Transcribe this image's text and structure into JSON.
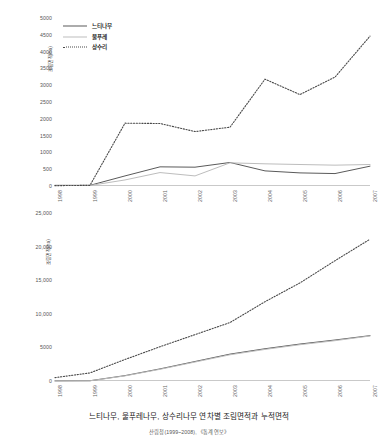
{
  "caption": {
    "title": "느티나무, 물푸레나무, 상수리나무 연차별 조림면적과 누적면적",
    "source": "산림청(1999~2008), 《통계연보》"
  },
  "legend": {
    "position": "top-left",
    "items": [
      {
        "label": "느티나무",
        "style": "solid-dark",
        "color": "#5a5a5a"
      },
      {
        "label": "물푸레",
        "style": "solid-light",
        "color": "#bdbdbd"
      },
      {
        "label": "상수리",
        "style": "dotted",
        "color": "#4a4a4a"
      }
    ]
  },
  "chart_data": [
    {
      "type": "line",
      "title": "",
      "xlabel": "",
      "ylabel": "조림면적(ha)",
      "grid": false,
      "legend_position": "top-left",
      "x": [
        "1998",
        "1999",
        "2000",
        "2001",
        "2002",
        "2003",
        "2004",
        "2005",
        "2006",
        "2007"
      ],
      "xlim": [
        0,
        9
      ],
      "ylim": [
        0,
        5000
      ],
      "yticks": [
        0,
        500,
        1000,
        1500,
        2000,
        2500,
        3000,
        3500,
        4000,
        4500,
        5000
      ],
      "ytick_labels": [
        "0",
        "500",
        "1000",
        "1500",
        "2000",
        "2500",
        "3000",
        "3500",
        "4000",
        "4500",
        "5000"
      ],
      "series": [
        {
          "name": "느티나무",
          "style": "solid-dark",
          "color": "#5a5a5a",
          "values": [
            20,
            20,
            300,
            570,
            560,
            700,
            450,
            390,
            370,
            590
          ]
        },
        {
          "name": "물푸레",
          "style": "solid-light",
          "color": "#bdbdbd",
          "values": [
            15,
            15,
            180,
            400,
            300,
            690,
            660,
            640,
            620,
            640
          ]
        },
        {
          "name": "상수리",
          "style": "dotted",
          "color": "#4a4a4a",
          "values": [
            10,
            20,
            1870,
            1860,
            1620,
            1750,
            3180,
            2720,
            3240,
            4460
          ]
        }
      ]
    },
    {
      "type": "line",
      "title": "",
      "xlabel": "",
      "ylabel": "조림면적(ha)",
      "grid": false,
      "legend_position": "none",
      "x": [
        "1998",
        "1999",
        "2000",
        "2001",
        "2002",
        "2003",
        "2004",
        "2005",
        "2006",
        "2007"
      ],
      "xlim": [
        0,
        9
      ],
      "ylim": [
        0,
        25000
      ],
      "yticks": [
        0,
        5000,
        10000,
        15000,
        20000,
        25000
      ],
      "ytick_labels": [
        "0",
        "5000",
        "10,000",
        "15,000",
        "20,000",
        "25,000"
      ],
      "series": [
        {
          "name": "느티나무",
          "style": "solid-dark",
          "color": "#5a5a5a",
          "values": [
            20,
            40,
            800,
            1800,
            2900,
            4000,
            4800,
            5500,
            6100,
            6750
          ]
        },
        {
          "name": "물푸레",
          "style": "solid-light",
          "color": "#bdbdbd",
          "values": [
            15,
            30,
            760,
            1740,
            2820,
            3900,
            4700,
            5400,
            6000,
            6700
          ]
        },
        {
          "name": "상수리",
          "style": "dotted",
          "color": "#4a4a4a",
          "values": [
            500,
            1200,
            3200,
            5100,
            6900,
            8700,
            11800,
            14600,
            17900,
            21100
          ]
        }
      ]
    }
  ]
}
